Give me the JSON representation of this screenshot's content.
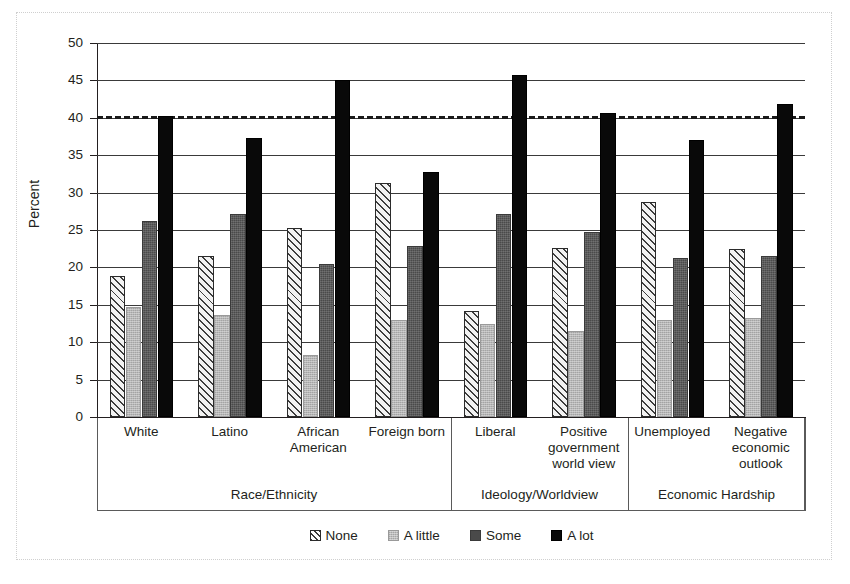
{
  "chart_data": {
    "type": "bar",
    "title": "",
    "xlabel": "",
    "ylabel": "Percent",
    "ylim": [
      0,
      50
    ],
    "ytick_step": 5,
    "yticks": [
      0,
      5,
      10,
      15,
      20,
      25,
      30,
      35,
      40,
      45,
      50
    ],
    "grid": true,
    "legend_position": "bottom",
    "categories": [
      "White",
      "Latino",
      "African American",
      "Foreign born",
      "Liberal",
      "Positive government world view",
      "Unemployed",
      "Negative economic outlook"
    ],
    "category_groups": [
      {
        "label": "Race/Ethnicity",
        "categories": [
          "White",
          "Latino",
          "African American",
          "Foreign born"
        ]
      },
      {
        "label": "Ideology/Worldview",
        "categories": [
          "Liberal",
          "Positive government world view"
        ]
      },
      {
        "label": "Economic Hardship",
        "categories": [
          "Unemployed",
          "Negative economic outlook"
        ]
      }
    ],
    "series": [
      {
        "name": "None",
        "fill": "diagonal-hatch",
        "color": "#f2f2f2",
        "values": [
          18.8,
          21.5,
          25.3,
          31.3,
          14.2,
          22.6,
          28.8,
          22.5
        ]
      },
      {
        "name": "A little",
        "fill": "light-stipple",
        "color": "#b6b6b6",
        "values": [
          14.7,
          13.6,
          8.3,
          13.0,
          12.4,
          11.5,
          13.0,
          13.2
        ]
      },
      {
        "name": "Some",
        "fill": "dark-gray",
        "color": "#4a4a4a",
        "values": [
          26.2,
          27.2,
          20.5,
          22.8,
          27.2,
          24.8,
          21.3,
          21.5
        ]
      },
      {
        "name": "A lot",
        "fill": "solid-black",
        "color": "#090909",
        "values": [
          40.2,
          37.3,
          45.1,
          32.7,
          45.7,
          40.6,
          37.0,
          41.9
        ]
      }
    ],
    "reference_line": {
      "value": 40.3,
      "style": "dashed",
      "color": "#1a1a1a",
      "label": ""
    },
    "annotations": []
  },
  "axis": {
    "y_title": "Percent",
    "y_tick_labels": [
      "50",
      "45",
      "40",
      "35",
      "30",
      "25",
      "20",
      "15",
      "10",
      "5",
      "0"
    ]
  },
  "category_labels": [
    {
      "lines": [
        "White"
      ]
    },
    {
      "lines": [
        "Latino"
      ]
    },
    {
      "lines": [
        "African",
        "American"
      ]
    },
    {
      "lines": [
        "Foreign born"
      ]
    },
    {
      "lines": [
        "Liberal"
      ]
    },
    {
      "lines": [
        "Positive",
        "government",
        "world view"
      ]
    },
    {
      "lines": [
        "Unemployed"
      ]
    },
    {
      "lines": [
        "Negative",
        "economic",
        "outlook"
      ]
    }
  ],
  "group_labels": [
    "Race/Ethnicity",
    "Ideology/Worldview",
    "Economic Hardship"
  ],
  "legend": {
    "items": [
      {
        "label": "None",
        "fill": "none"
      },
      {
        "label": "A little",
        "fill": "alittle"
      },
      {
        "label": "Some",
        "fill": "some"
      },
      {
        "label": "A lot",
        "fill": "alot"
      }
    ]
  }
}
